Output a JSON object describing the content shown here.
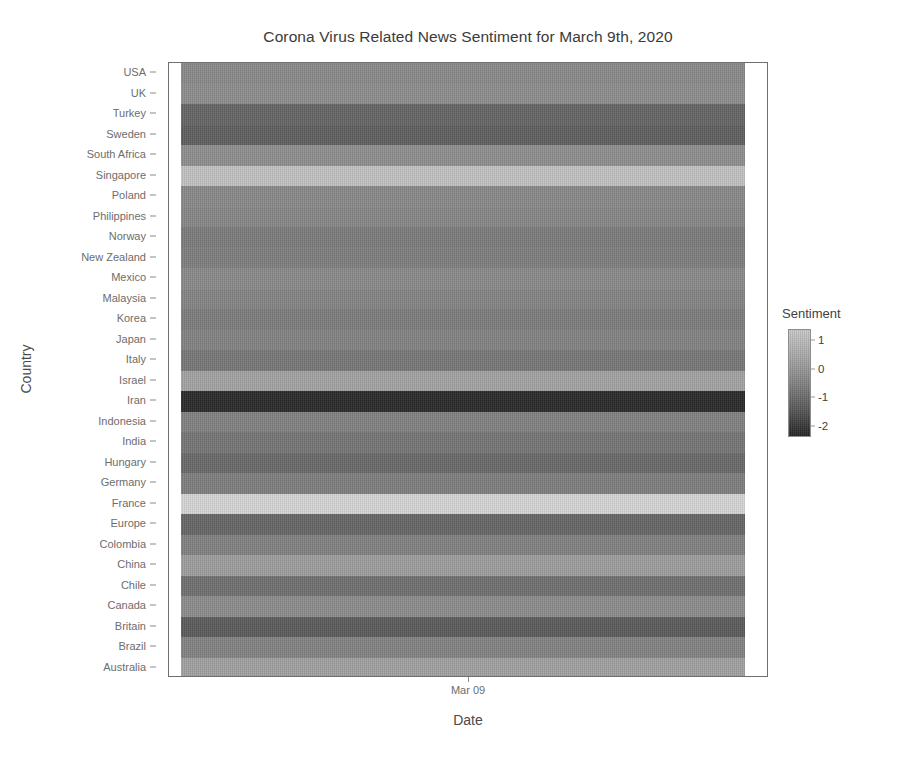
{
  "chart_data": {
    "type": "heatmap",
    "title": "Corona Virus Related News Sentiment for March 9th, 2020",
    "xlabel": "Date",
    "ylabel": "Country",
    "legend_title": "Sentiment",
    "legend_position": "right",
    "grid": false,
    "colormap": "grayscale-viridis-like",
    "colormap_light_hex": "#c9c9c9",
    "colormap_dark_hex": "#232323",
    "x": [
      "Mar 09"
    ],
    "x_tick_labels": [
      "Mar 09"
    ],
    "zlim": [
      -2.4,
      1.4
    ],
    "z_tick_values": [
      1,
      0,
      -1,
      -2
    ],
    "z_tick_labels": [
      "1",
      "0",
      "-1",
      "-2"
    ],
    "categories": [
      "USA",
      "UK",
      "Turkey",
      "Sweden",
      "South Africa",
      "Singapore",
      "Poland",
      "Philippines",
      "Norway",
      "New Zealand",
      "Mexico",
      "Malaysia",
      "Korea",
      "Japan",
      "Italy",
      "Israel",
      "Iran",
      "Indonesia",
      "India",
      "Hungary",
      "Germany",
      "France",
      "Europe",
      "Colombia",
      "China",
      "Chile",
      "Canada",
      "Britain",
      "Brazil",
      "Australia"
    ],
    "values": [
      -0.45,
      -0.55,
      -1.35,
      -1.45,
      -0.6,
      0.95,
      -0.4,
      -0.35,
      -0.05,
      -0.15,
      -0.45,
      -0.3,
      -0.1,
      -0.25,
      0.1,
      0.45,
      -2.3,
      -0.2,
      0.15,
      -1.2,
      -0.15,
      1.25,
      -1.3,
      -0.2,
      0.35,
      -0.95,
      -0.5,
      -1.55,
      -0.25,
      0.4
    ],
    "cell_colors": [
      "#8a8a8a",
      "#8d8d8d",
      "#656565",
      "#606060",
      "#8f8f8f",
      "#c2c2c2",
      "#898989",
      "#878787",
      "#7c7c7c",
      "#7f7f7f",
      "#8a8a8a",
      "#858585",
      "#7d7d7d",
      "#838383",
      "#787878",
      "#a3a3a3",
      "#2b2b2b",
      "#818181",
      "#767676",
      "#6a6a6a",
      "#7f7f7f",
      "#d6d6d6",
      "#676767",
      "#818181",
      "#9e9e9e",
      "#707070",
      "#8c8c8c",
      "#5c5c5c",
      "#838383",
      "#a1a1a1"
    ]
  }
}
